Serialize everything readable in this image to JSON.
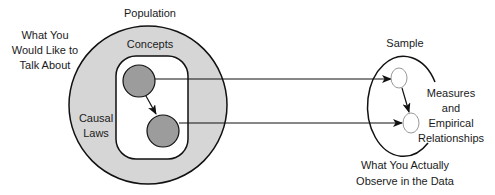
{
  "diagram": {
    "population_label": "Population",
    "left_caption": [
      "What You",
      "Would Like to",
      "Talk About"
    ],
    "concepts_label": "Concepts",
    "causal_laws_label": [
      "Causal",
      "Laws"
    ],
    "sample_label": "Sample",
    "measures_label": [
      "Measures",
      "and",
      "Empirical",
      "Relationships"
    ],
    "bottom_caption": [
      "What You Actually",
      "Observe in the Data"
    ]
  },
  "colors": {
    "population_fill": "#d6d6d6",
    "concept_node_fill": "#9c9c9c",
    "stroke": "#111111",
    "sample_node_stroke": "#999999"
  }
}
